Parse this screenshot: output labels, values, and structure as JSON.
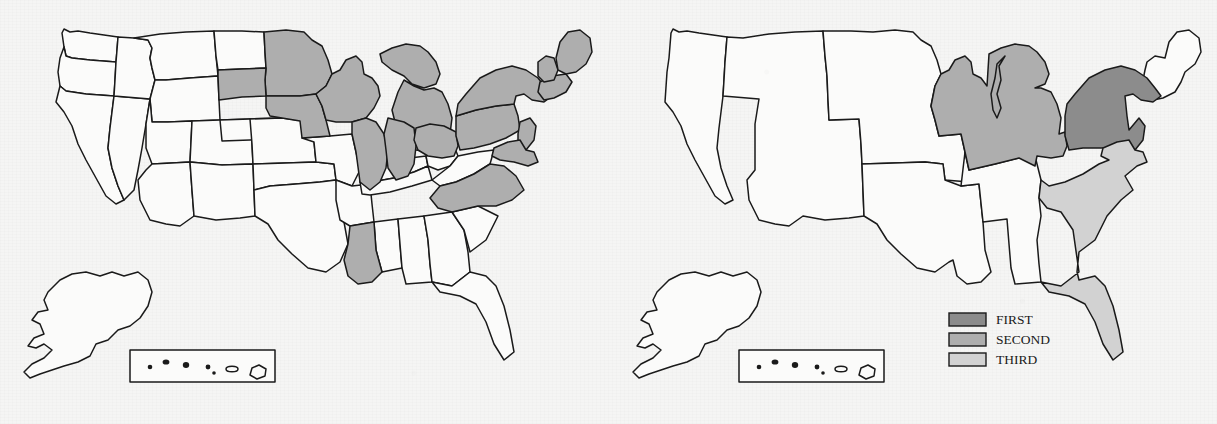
{
  "figure": {
    "type": "choropleth-map-pair",
    "background_color": "#f5f5f4",
    "outline_color": "#1a1a1a",
    "unshaded_color": "#fbfbfa"
  },
  "shade_colors": {
    "first": "#8c8c8c",
    "second": "#aeaeae",
    "third": "#d2d2d2",
    "none": "#fbfbfa"
  },
  "legend": {
    "present_on": "right-map",
    "items": [
      {
        "label": "FIRST",
        "color": "#8c8c8c"
      },
      {
        "label": "SECOND",
        "color": "#aeaeae"
      },
      {
        "label": "THIRD",
        "color": "#d2d2d2"
      }
    ]
  },
  "maps": [
    {
      "id": "left-map",
      "name": "state-level-choropleth",
      "unit": "state",
      "has_legend": false,
      "has_alaska_inset": true,
      "has_hawaii_inset": true,
      "shaded_regions": [
        {
          "name": "Minnesota",
          "shade": "second"
        },
        {
          "name": "South Dakota",
          "shade": "second"
        },
        {
          "name": "Iowa",
          "shade": "second"
        },
        {
          "name": "Wisconsin",
          "shade": "second"
        },
        {
          "name": "Michigan",
          "shade": "second"
        },
        {
          "name": "Illinois",
          "shade": "second"
        },
        {
          "name": "Indiana",
          "shade": "second"
        },
        {
          "name": "Ohio",
          "shade": "second"
        },
        {
          "name": "Pennsylvania",
          "shade": "second"
        },
        {
          "name": "New York",
          "shade": "second"
        },
        {
          "name": "New Jersey",
          "shade": "second"
        },
        {
          "name": "Maryland",
          "shade": "second"
        },
        {
          "name": "Delaware",
          "shade": "second"
        },
        {
          "name": "Massachusetts",
          "shade": "second"
        },
        {
          "name": "Vermont",
          "shade": "second"
        },
        {
          "name": "Maine",
          "shade": "second"
        },
        {
          "name": "North Carolina",
          "shade": "second"
        },
        {
          "name": "Louisiana",
          "shade": "second"
        }
      ],
      "unshaded_note": "All western, mountain, plains and remaining southern states are white"
    },
    {
      "id": "right-map",
      "name": "region-level-choropleth",
      "unit": "census-region",
      "has_legend": true,
      "has_alaska_inset": true,
      "has_hawaii_inset": true,
      "shaded_regions": [
        {
          "name": "Middle Atlantic",
          "shade": "first",
          "states": "NY, PA, NJ"
        },
        {
          "name": "East North Central",
          "shade": "second",
          "states": "WI, MI, IL, IN, OH"
        },
        {
          "name": "South Atlantic",
          "shade": "third",
          "states": "VA, NC, SC, GA, FL"
        }
      ],
      "unshaded_note": "Pacific, Mountain, West North Central, West South Central, East South Central and New England are white"
    }
  ]
}
